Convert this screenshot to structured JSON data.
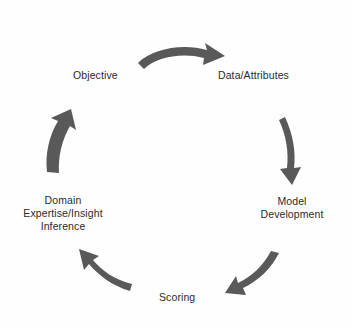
{
  "diagram": {
    "type": "circular-process-cycle",
    "title": "",
    "arrow_color": "#595959",
    "text_color": "#2b2b2b",
    "background_color": "#fefefe",
    "direction": "clockwise",
    "stages": [
      {
        "id": "objective",
        "label": "Objective",
        "position": "top-left",
        "order": 1
      },
      {
        "id": "data-attributes",
        "label": "Data/Attributes",
        "position": "top-right",
        "order": 2
      },
      {
        "id": "model-development",
        "label": "Model\nDevelopment",
        "position": "right",
        "order": 3
      },
      {
        "id": "scoring",
        "label": "Scoring",
        "position": "bottom",
        "order": 4
      },
      {
        "id": "domain-expertise",
        "label": "Domain\nExpertise/Insight\nInference",
        "position": "left",
        "order": 5
      }
    ],
    "arrows": [
      {
        "id": "arrow-objective-to-data",
        "from": "objective",
        "to": "data-attributes",
        "direction": "right"
      },
      {
        "id": "arrow-data-to-model",
        "from": "data-attributes",
        "to": "model-development",
        "direction": "down"
      },
      {
        "id": "arrow-model-to-scoring",
        "from": "model-development",
        "to": "scoring",
        "direction": "down-left"
      },
      {
        "id": "arrow-scoring-to-domain",
        "from": "scoring",
        "to": "domain-expertise",
        "direction": "up-left"
      },
      {
        "id": "arrow-domain-to-objective",
        "from": "domain-expertise",
        "to": "objective",
        "direction": "up"
      }
    ]
  }
}
